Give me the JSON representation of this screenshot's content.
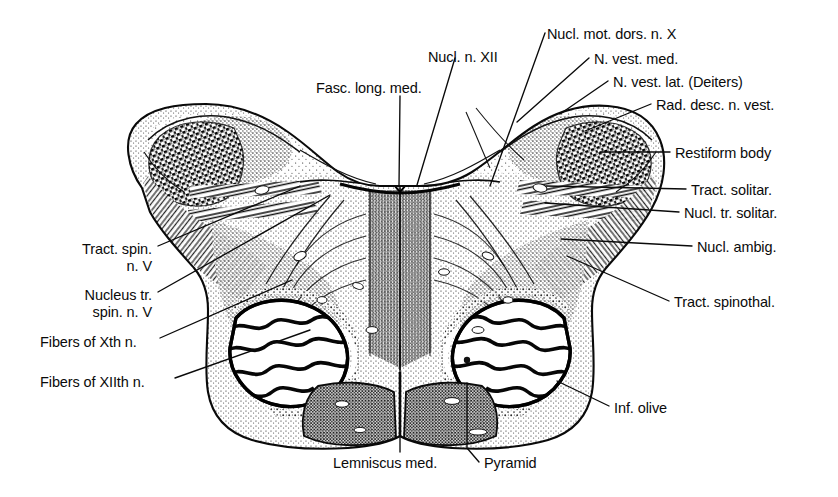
{
  "figure": {
    "background_color": "#ffffff",
    "ink_color": "#101010",
    "style": "engraved histological line drawing, stippled myelin-stained section"
  },
  "labels": [
    {
      "id": "fasc-long-med",
      "text": "Fasc. long. med.",
      "align": "left",
      "x": 316,
      "y": 80,
      "lines": [
        "Fasc. long. med."
      ]
    },
    {
      "id": "nucl-n-xii",
      "text": "Nucl. n. XII",
      "align": "left",
      "x": 428,
      "y": 49,
      "lines": [
        "Nucl. n. XII"
      ]
    },
    {
      "id": "nucl-mot-dors-n-x",
      "text": "Nucl. mot. dors. n. X",
      "align": "left",
      "x": 547,
      "y": 26,
      "lines": [
        "Nucl. mot. dors. n. X"
      ]
    },
    {
      "id": "n-vest-med",
      "text": "N. vest. med.",
      "align": "left",
      "x": 594,
      "y": 51,
      "lines": [
        "N. vest. med."
      ]
    },
    {
      "id": "n-vest-lat-deiters",
      "text": "N. vest. lat. (Deiters)",
      "align": "left",
      "x": 613,
      "y": 74,
      "lines": [
        "N. vest. lat. (Deiters)"
      ]
    },
    {
      "id": "rad-desc-n-vest",
      "text": "Rad. desc. n. vest.",
      "align": "left",
      "x": 656,
      "y": 97,
      "lines": [
        "Rad. desc. n. vest."
      ]
    },
    {
      "id": "restiform-body",
      "text": "Restiform body",
      "align": "left",
      "x": 675,
      "y": 145,
      "lines": [
        "Restiform body"
      ]
    },
    {
      "id": "tract-solitar",
      "text": "Tract. solitar.",
      "align": "left",
      "x": 691,
      "y": 182,
      "lines": [
        "Tract. solitar."
      ]
    },
    {
      "id": "nucl-tr-solitar",
      "text": "Nucl. tr. solitar.",
      "align": "left",
      "x": 684,
      "y": 205,
      "lines": [
        "Nucl. tr. solitar."
      ]
    },
    {
      "id": "nucl-ambig",
      "text": "Nucl. ambig.",
      "align": "left",
      "x": 697,
      "y": 239,
      "lines": [
        "Nucl. ambig."
      ]
    },
    {
      "id": "tract-spinothal",
      "text": "Tract. spinothal.",
      "align": "left",
      "x": 674,
      "y": 294,
      "lines": [
        "Tract. spinothal."
      ]
    },
    {
      "id": "inf-olive",
      "text": "Inf. olive",
      "align": "left",
      "x": 614,
      "y": 400,
      "lines": [
        "Inf. olive"
      ]
    },
    {
      "id": "pyramid",
      "text": "Pyramid",
      "align": "left",
      "x": 484,
      "y": 455,
      "lines": [
        "Pyramid"
      ]
    },
    {
      "id": "lemniscus-med",
      "text": "Lemniscus med.",
      "align": "left",
      "x": 333,
      "y": 455,
      "lines": [
        "Lemniscus med."
      ]
    },
    {
      "id": "fibers-of-xiith-n",
      "text": "Fibers of XIIth n.",
      "align": "left",
      "x": 40,
      "y": 374,
      "lines": [
        "Fibers of XIIth n."
      ]
    },
    {
      "id": "fibers-of-xth-n",
      "text": "Fibers of Xth n.",
      "align": "left",
      "x": 40,
      "y": 334,
      "lines": [
        "Fibers of Xth n."
      ]
    },
    {
      "id": "nucleus-tr-spin-n-v",
      "text": "Nucleus tr. spin. n. V",
      "align": "right",
      "x": 152,
      "y": 287,
      "lines": [
        "Nucleus tr.",
        "spin. n. V"
      ]
    },
    {
      "id": "tract-spin-n-v",
      "text": "Tract. spin. n. V",
      "align": "right",
      "x": 152,
      "y": 241,
      "lines": [
        "Tract. spin.",
        "n. V"
      ]
    }
  ],
  "leaders": [
    {
      "id": "leader-fasc-long-med",
      "points": "400,96 399,186"
    },
    {
      "id": "leader-nucl-n-xii",
      "points": "455,58 417,185"
    },
    {
      "id": "leader-nucl-mot-dors-n-x",
      "points": "545,33 490,186"
    },
    {
      "id": "leader-n-vest-med",
      "points": "589,58 517,122"
    },
    {
      "id": "leader-n-vest-lat-deiters",
      "points": "608,81 560,114"
    },
    {
      "id": "leader-rad-desc-n-vest",
      "points": "651,104 585,131"
    },
    {
      "id": "leader-restiform-body",
      "points": "670,152 600,152"
    },
    {
      "id": "leader-tract-solitar",
      "points": "686,189 546,186"
    },
    {
      "id": "leader-nucl-tr-solitar",
      "points": "679,212 545,203"
    },
    {
      "id": "leader-nucl-ambig",
      "points": "692,246 561,239"
    },
    {
      "id": "leader-tract-spinothal",
      "points": "669,301 567,256"
    },
    {
      "id": "leader-inf-olive",
      "points": "609,406 557,381"
    },
    {
      "id": "leader-pyramid",
      "points": "479,462 467,448 467,383"
    },
    {
      "id": "leader-lemniscus-med",
      "points": "400,452 400,345"
    },
    {
      "id": "leader-fibers-of-xiith-n",
      "points": "175,378 310,330"
    },
    {
      "id": "leader-fibers-of-xth-n",
      "points": "160,338 292,280"
    },
    {
      "id": "leader-nucleus-tr-spin-n-v",
      "points": "158,292 330,195"
    },
    {
      "id": "leader-tract-spin-n-v",
      "points": "158,246 300,186"
    }
  ],
  "structures": [
    {
      "id": "outline",
      "name": "medulla-outline"
    },
    {
      "id": "left-olive",
      "name": "inferior-olive-left"
    },
    {
      "id": "right-olive",
      "name": "inferior-olive-right"
    },
    {
      "id": "left-pyramid",
      "name": "pyramid-left"
    },
    {
      "id": "right-pyramid",
      "name": "pyramid-right"
    },
    {
      "id": "medial-lemniscus",
      "name": "medial-lemniscus"
    },
    {
      "id": "restiform-left",
      "name": "restiform-body-left"
    },
    {
      "id": "restiform-right",
      "name": "restiform-body-right"
    },
    {
      "id": "fourth-ventricle",
      "name": "fourth-ventricle-floor"
    }
  ]
}
